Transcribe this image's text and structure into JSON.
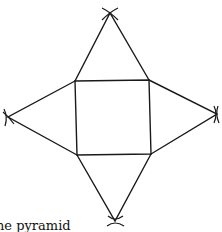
{
  "figure": {
    "caption": "he pyramid",
    "stroke_color": "#1a1a1a",
    "background": "#ffffff"
  },
  "geometry": {
    "square": [
      [
        75,
        81
      ],
      [
        149,
        80
      ],
      [
        151,
        154
      ],
      [
        77,
        155
      ]
    ],
    "apexes": {
      "top": [
        110,
        13
      ],
      "left": [
        8,
        117
      ],
      "right": [
        217,
        114
      ],
      "bottom": [
        115,
        221
      ]
    }
  }
}
